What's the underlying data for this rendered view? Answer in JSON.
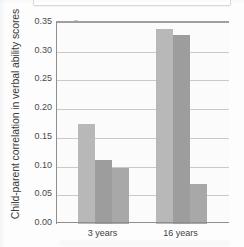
{
  "chart_data": {
    "type": "bar",
    "title": "",
    "xlabel": "",
    "ylabel": "Child-parent correlation in verbal ability scores",
    "categories": [
      "3 years",
      "16 years"
    ],
    "series": [
      {
        "name": "series-1",
        "color": "#b8b8b8",
        "values": [
          0.175,
          0.34
        ]
      },
      {
        "name": "series-2",
        "color": "#9d9d9d",
        "values": [
          0.112,
          0.33
        ]
      },
      {
        "name": "series-3",
        "color": "#a8a8a8",
        "values": [
          0.097,
          0.07
        ]
      }
    ],
    "ylim": [
      0.0,
      0.35
    ],
    "ytick_labels": [
      "0.35",
      "0.30",
      "0.25",
      "0.20",
      "0.15",
      "0.10",
      "0.05",
      "0.00"
    ],
    "ytick_values": [
      0.35,
      0.3,
      0.25,
      0.2,
      0.15,
      0.1,
      0.05,
      0.0
    ],
    "grid": true,
    "grid_axis": "y",
    "legend": "none",
    "legend_position": "none"
  },
  "axes": {
    "y_title": "Child-parent correlation in verbal ability scores"
  },
  "colors": {
    "plot_background": "#fbfbfb",
    "gridline": "#c9c9c9",
    "axis_line": "#8f8f8f",
    "tick_text": "#4a4a4a",
    "label_text": "#3d3d3d"
  }
}
